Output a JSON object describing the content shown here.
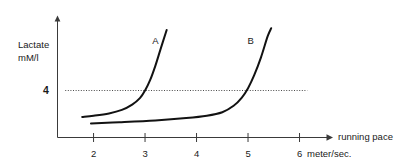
{
  "chart_data": {
    "type": "line",
    "title": "",
    "xlabel": "running pace",
    "xunit": "meter/sec.",
    "ylabel_line1": "Lactate",
    "ylabel_line2": "mM/l",
    "xlim": [
      1.3,
      6.65
    ],
    "ylim": [
      0,
      10
    ],
    "grid": false,
    "legend_position": "inline-curve-labels",
    "xticks": [
      2,
      3,
      4,
      5,
      6
    ],
    "xtick_labels": [
      "2",
      "3",
      "4",
      "5",
      "6"
    ],
    "yticks": [
      4
    ],
    "ytick_labels": [
      "4"
    ],
    "threshold": {
      "value": 4,
      "label": "4",
      "style": "dotted",
      "x_start": 1.45,
      "x_end": 6.15
    },
    "annotations": [
      {
        "text": "A",
        "x": 3.2,
        "y": 8.0
      },
      {
        "text": "B",
        "x": 5.05,
        "y": 8.0
      }
    ],
    "series": [
      {
        "name": "A",
        "label": "A",
        "color": "#121212",
        "points": [
          {
            "x": 1.78,
            "y": 1.75
          },
          {
            "x": 2.0,
            "y": 1.85
          },
          {
            "x": 2.3,
            "y": 2.05
          },
          {
            "x": 2.55,
            "y": 2.35
          },
          {
            "x": 2.75,
            "y": 2.8
          },
          {
            "x": 2.9,
            "y": 3.35
          },
          {
            "x": 3.0,
            "y": 4.0
          },
          {
            "x": 3.1,
            "y": 4.9
          },
          {
            "x": 3.2,
            "y": 6.1
          },
          {
            "x": 3.3,
            "y": 7.5
          },
          {
            "x": 3.42,
            "y": 9.15
          }
        ]
      },
      {
        "name": "B",
        "label": "B",
        "color": "#121212",
        "points": [
          {
            "x": 1.95,
            "y": 1.2
          },
          {
            "x": 2.5,
            "y": 1.3
          },
          {
            "x": 3.2,
            "y": 1.45
          },
          {
            "x": 3.8,
            "y": 1.65
          },
          {
            "x": 4.2,
            "y": 1.85
          },
          {
            "x": 4.5,
            "y": 2.15
          },
          {
            "x": 4.72,
            "y": 2.7
          },
          {
            "x": 4.88,
            "y": 3.4
          },
          {
            "x": 5.0,
            "y": 4.2
          },
          {
            "x": 5.12,
            "y": 5.3
          },
          {
            "x": 5.25,
            "y": 6.8
          },
          {
            "x": 5.38,
            "y": 8.6
          },
          {
            "x": 5.45,
            "y": 9.3
          }
        ]
      }
    ]
  }
}
